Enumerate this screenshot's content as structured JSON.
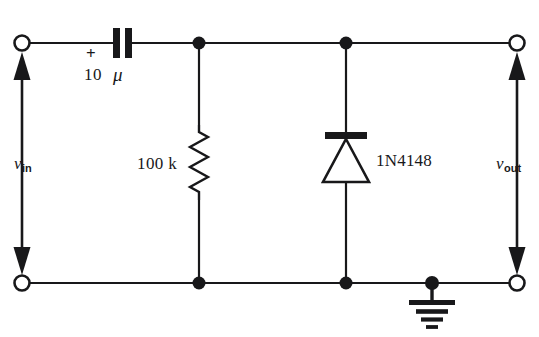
{
  "diagram": {
    "type": "electronic-schematic",
    "background_color": "#ffffff",
    "ink_color": "#18181a",
    "labels": {
      "v_in": "v",
      "v_in_sub": "in",
      "v_out": "v",
      "v_out_sub": "out",
      "capacitor_value": "10",
      "capacitor_unit": "μ",
      "capacitor_polarity": "+",
      "resistor_value": "100 k",
      "diode_part": "1N4148"
    },
    "components": [
      {
        "id": "C1",
        "name": "capacitor",
        "symbol": "polarized-capacitor",
        "value": "10 μ",
        "polarity_marker": "+",
        "orientation": "horizontal",
        "position": {
          "x": 122,
          "y": 43
        }
      },
      {
        "id": "R1",
        "name": "resistor",
        "symbol": "zigzag-resistor",
        "value": "100 k",
        "orientation": "vertical",
        "position": {
          "x": 199,
          "y": 163
        }
      },
      {
        "id": "D1",
        "name": "diode",
        "symbol": "diode",
        "value": "1N4148",
        "orientation": "vertical",
        "cathode": "top",
        "position": {
          "x": 346,
          "y": 160
        }
      },
      {
        "id": "GND",
        "name": "ground",
        "symbol": "earth-ground",
        "position": {
          "x": 432,
          "y": 283
        }
      }
    ],
    "terminals": [
      {
        "id": "in-top",
        "name": "input-terminal-top",
        "style": "open-circle",
        "x": 22,
        "y": 43
      },
      {
        "id": "in-bottom",
        "name": "input-terminal-bottom",
        "style": "open-circle",
        "x": 22,
        "y": 283
      },
      {
        "id": "out-top",
        "name": "output-terminal-top",
        "style": "open-circle",
        "x": 517,
        "y": 43
      },
      {
        "id": "out-bottom",
        "name": "output-terminal-bottom",
        "style": "open-circle",
        "x": 517,
        "y": 283
      }
    ],
    "nodes": [
      {
        "id": "n1",
        "name": "junction-capacitor-resistor",
        "x": 199,
        "y": 43
      },
      {
        "id": "n2",
        "name": "junction-diode-output",
        "x": 346,
        "y": 43
      },
      {
        "id": "n3",
        "name": "junction-resistor-return",
        "x": 199,
        "y": 283
      },
      {
        "id": "n4",
        "name": "junction-diode-return",
        "x": 346,
        "y": 283
      },
      {
        "id": "n5",
        "name": "junction-ground",
        "x": 432,
        "y": 283
      }
    ]
  }
}
